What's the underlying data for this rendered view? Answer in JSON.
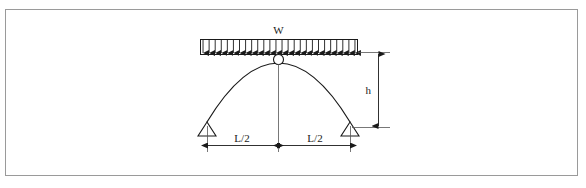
{
  "figure": {
    "type": "three-hinged-arch-diagram",
    "background_color": "#ffffff",
    "border_color": "#9a9a9a",
    "line_color": "#1a1a1a"
  },
  "labels": {
    "load": "W",
    "span_left": "L/2",
    "span_right": "L/2",
    "height": "h"
  },
  "chart_data": {
    "type": "diagram",
    "title": "",
    "elements": {
      "arch": {
        "shape": "parabolic",
        "left_support_x": 207,
        "right_support_x": 350,
        "crown_x": 278.5,
        "crown_y": 59,
        "base_y": 122
      },
      "load_band": {
        "left_x": 200,
        "right_x": 358,
        "top_y": 39,
        "bottom_y": 54,
        "arrow_count": 26,
        "direction": "downward"
      },
      "supports": [
        {
          "name": "pinned-support-left",
          "x": 207,
          "y": 122,
          "width": 18,
          "height": 14
        },
        {
          "name": "pinned-support-right",
          "x": 350,
          "y": 122,
          "width": 18,
          "height": 14
        }
      ],
      "hinge": {
        "x": 278.5,
        "y": 59,
        "radius": 5
      },
      "dimensions": [
        {
          "name": "span_left",
          "label": "L/2",
          "from_x": 207,
          "to_x": 278.5,
          "y": 145
        },
        {
          "name": "span_right",
          "label": "L/2",
          "from_x": 278.5,
          "to_x": 350,
          "y": 145
        },
        {
          "name": "rise",
          "label": "h",
          "x": 378,
          "from_y": 54,
          "to_y": 127
        }
      ]
    }
  }
}
